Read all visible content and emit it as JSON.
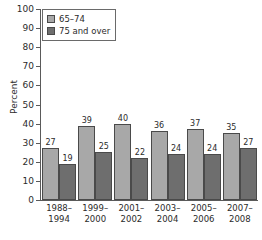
{
  "chart_data": {
    "type": "bar",
    "title": "",
    "subtitle": "",
    "xlabel": "",
    "ylabel": "Percent",
    "ylim": [
      0,
      100
    ],
    "ytick_step": 10,
    "yticks": [
      0,
      10,
      20,
      30,
      40,
      50,
      60,
      70,
      80,
      90,
      100
    ],
    "grid": false,
    "legend_position": "upper-left-inside",
    "categories": [
      "1988–\n1994",
      "1999–\n2000",
      "2001–\n2002",
      "2003–\n2004",
      "2005–\n2006",
      "2007–\n2008"
    ],
    "category_lines": [
      [
        "1988–",
        "1994"
      ],
      [
        "1999–",
        "2000"
      ],
      [
        "2001–",
        "2002"
      ],
      [
        "2003–",
        "2004"
      ],
      [
        "2005–",
        "2006"
      ],
      [
        "2007–",
        "2008"
      ]
    ],
    "series": [
      {
        "name": "65–74",
        "color": "#a8a8a8",
        "values": [
          27,
          39,
          40,
          36,
          37,
          35
        ]
      },
      {
        "name": "75 and over",
        "color": "#6e6e6e",
        "values": [
          19,
          25,
          22,
          24,
          24,
          27
        ]
      }
    ]
  },
  "legend": {
    "items": [
      {
        "label": "65–74",
        "swatch_name": "legend-swatch-65-74"
      },
      {
        "label": "75 and over",
        "swatch_name": "legend-swatch-75-and-over"
      }
    ]
  },
  "colors": {
    "series_65_74": "#a8a8a8",
    "series_75_and_over": "#6e6e6e",
    "axis": "#5a5a5a",
    "text": "#2b2b2b",
    "background": "#ffffff"
  }
}
